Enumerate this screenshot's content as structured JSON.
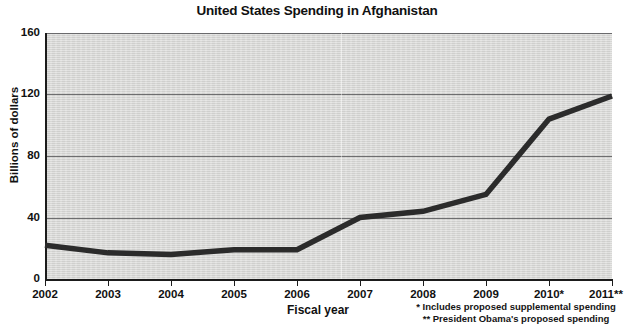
{
  "chart_data": {
    "type": "line",
    "title": "United States Spending in Afghanistan",
    "xlabel": "Fiscal year",
    "ylabel": "Billions of dollars",
    "categories": [
      "2002",
      "2003",
      "2004",
      "2005",
      "2006",
      "2007",
      "2008",
      "2009",
      "2010*",
      "2011**"
    ],
    "x": [
      2002,
      2003,
      2004,
      2005,
      2006,
      2007,
      2008,
      2009,
      2010,
      2011
    ],
    "values": [
      22,
      17,
      16,
      19,
      19,
      40,
      44,
      55,
      104,
      119
    ],
    "series": [
      {
        "name": "United States Spending in Afghanistan",
        "values": [
          22,
          17,
          16,
          19,
          19,
          40,
          44,
          55,
          104,
          119
        ]
      }
    ],
    "ylim": [
      0,
      160
    ],
    "yticks": [
      0,
      40,
      80,
      120,
      160
    ],
    "ytick_labels": [
      "0",
      "40",
      "80",
      "120",
      "160"
    ],
    "grid": true,
    "grid_axis": "y",
    "legend": false,
    "legend_position": "none",
    "line_color": "#2b2b2b",
    "plot_background": "#d6d6d4",
    "annotations": [
      "* Includes proposed supplemental spending",
      "** President Obama's proposed spending"
    ]
  },
  "chart": {
    "title": "United States Spending in Afghanistan",
    "y_axis": {
      "title": "Billions of dollars",
      "ticks": [
        {
          "label": "160",
          "value": 160
        },
        {
          "label": "120",
          "value": 120
        },
        {
          "label": "80",
          "value": 80
        },
        {
          "label": "40",
          "value": 40
        },
        {
          "label": "0",
          "value": 0
        }
      ]
    },
    "x_axis": {
      "title": "Fiscal year",
      "ticks": [
        {
          "label": "2002"
        },
        {
          "label": "2003"
        },
        {
          "label": "2004"
        },
        {
          "label": "2005"
        },
        {
          "label": "2006"
        },
        {
          "label": "2007"
        },
        {
          "label": "2008"
        },
        {
          "label": "2009"
        },
        {
          "label": "2010*"
        },
        {
          "label": "2011**"
        }
      ]
    },
    "footnotes": {
      "single_asterisk": "* Includes proposed supplemental spending",
      "double_asterisk": "** President Obama's proposed spending"
    },
    "source": ""
  }
}
